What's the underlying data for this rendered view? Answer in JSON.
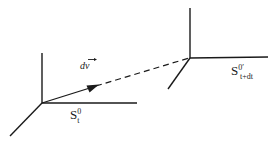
{
  "figure": {
    "background_color": "#ffffff",
    "stroke_color": "#1a1a1a",
    "width": 274,
    "height": 142
  },
  "labels": {
    "left_frame": {
      "base": "S",
      "superscript": "0",
      "subscript": "t",
      "full": "S0t"
    },
    "right_frame": {
      "base": "S",
      "superscript": "0′",
      "subscript": "t+dt",
      "full": "S0′t+dt"
    },
    "vector": {
      "base": "d",
      "symbol": "v",
      "full": "dv",
      "accent": "vector-arrow"
    }
  },
  "elements": {
    "left_axis_vertical": "axis-line",
    "left_axis_horizontal": "axis-line",
    "left_axis_diagonal": "axis-line",
    "right_axis_vertical": "axis-line",
    "right_axis_horizontal": "axis-line",
    "right_axis_diagonal": "axis-line",
    "displacement_arrow": "solid-arrow",
    "connector": "dashed-line"
  }
}
